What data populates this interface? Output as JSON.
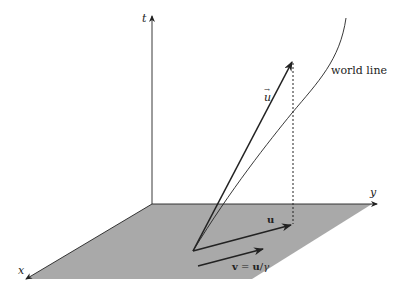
{
  "diagram": {
    "type": "spacetime-diagram",
    "axes": {
      "t": "t",
      "x": "x",
      "y": "y"
    },
    "labels": {
      "four_velocity": "u",
      "four_velocity_arrow": "→",
      "world_line": "world line",
      "spatial_u": "u",
      "velocity_v": "v",
      "velocity_eq": " = ",
      "velocity_u": "u",
      "velocity_slash": "/",
      "velocity_gamma": "γ"
    },
    "colors": {
      "plane": "#a9a9a9",
      "lines": "#222222"
    }
  }
}
